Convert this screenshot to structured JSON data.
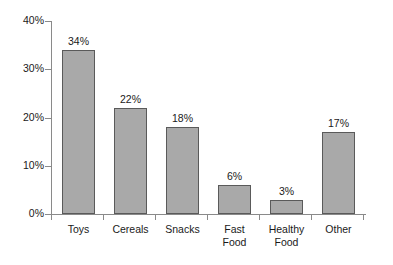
{
  "chart_data": {
    "type": "bar",
    "title": "",
    "subtitle": "",
    "xlabel": "",
    "ylabel": "",
    "categories": [
      "Toys",
      "Cereals",
      "Snacks",
      "Fast\nFood",
      "Healthy\nFood",
      "Other"
    ],
    "values": [
      34,
      22,
      18,
      6,
      3,
      17
    ],
    "value_labels": [
      "34%",
      "22%",
      "18%",
      "6%",
      "3%",
      "17%"
    ],
    "ylim": [
      0,
      40
    ],
    "ytick_values": [
      0,
      10,
      20,
      30,
      40
    ],
    "ytick_labels": [
      "0%",
      "10%",
      "20%",
      "30%",
      "40%"
    ],
    "grid": false,
    "legend": null,
    "bar_color": "#a9a9a9",
    "bar_edge_color": "#5a5a5a",
    "axis_color": "#8a8a8a",
    "background_color": "#ffffff"
  }
}
